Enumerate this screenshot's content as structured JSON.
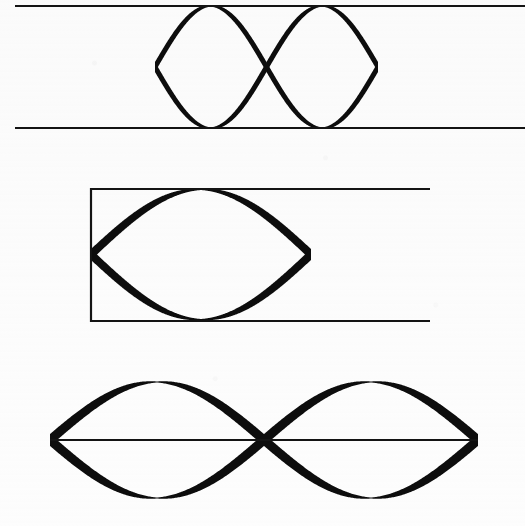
{
  "page": {
    "background_color": "#fdfdfd",
    "ink_color": "#0d0d0d",
    "width": 525,
    "height": 526,
    "figure_count": 3
  },
  "figures": [
    {
      "id": "figure-1",
      "name": "open-band-two-crossings",
      "caption": "",
      "frame": {
        "type": "parallel-rules",
        "left": 15,
        "right": 525,
        "top_y": 6,
        "bottom_y": 128,
        "stroke_width": 2,
        "has_left_edge": false,
        "has_right_edge": false
      },
      "curves": {
        "type": "crossed-sinusoids",
        "count": 2,
        "amplitude": 61,
        "period": 223,
        "phase_deg": [
          0,
          180
        ],
        "max_stroke": 10,
        "min_stroke": 1,
        "crossings": [
          {
            "x": 155,
            "y": 67
          },
          {
            "x": 378,
            "y": 67
          }
        ],
        "lens_centers_x": [
          266,
          489
        ]
      }
    },
    {
      "id": "figure-2",
      "name": "boxed-band-one-crossing",
      "caption": "",
      "frame": {
        "type": "rectangle-open-right",
        "left": 91,
        "right": 430,
        "top_y": 189,
        "bottom_y": 320,
        "stroke_width": 2,
        "has_left_edge": true,
        "has_right_edge": false
      },
      "curves": {
        "type": "crossed-sinusoids",
        "count": 2,
        "amplitude": 65,
        "period": 440,
        "phase_deg": [
          0,
          180
        ],
        "max_stroke": 11,
        "min_stroke": 1,
        "crossings": [
          {
            "x": 91,
            "y": 255
          },
          {
            "x": 311,
            "y": 255
          }
        ],
        "lens_centers_x": [
          201,
          421
        ]
      }
    },
    {
      "id": "figure-3",
      "name": "double-lens-centerline",
      "caption": "",
      "frame": {
        "type": "single-axis-rule",
        "left": 50,
        "right": 478,
        "axis_y": 440,
        "stroke_width": 2,
        "has_left_edge": false,
        "has_right_edge": false
      },
      "curves": {
        "type": "crossed-sinusoids",
        "count": 2,
        "amplitude": 58,
        "period": 428,
        "phase_deg": [
          0,
          180
        ],
        "max_stroke": 12,
        "min_stroke": 1,
        "crossings": [
          {
            "x": 50,
            "y": 440
          },
          {
            "x": 264,
            "y": 440
          },
          {
            "x": 478,
            "y": 440
          }
        ],
        "lens_centers_x": [
          157,
          371
        ]
      }
    }
  ]
}
